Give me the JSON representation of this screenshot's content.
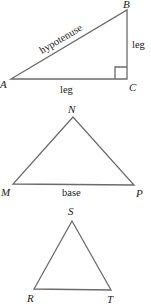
{
  "figure": {
    "right_triangle": {
      "vertices": {
        "A": "A",
        "B": "B",
        "C": "C"
      },
      "labels": {
        "hypotenuse": "hypotenuse",
        "vertical_leg": "leg",
        "horizontal_leg": "leg"
      },
      "right_angle_at": "C"
    },
    "base_triangle": {
      "vertices": {
        "N": "N",
        "M": "M",
        "P": "P"
      },
      "labels": {
        "base": "base"
      }
    },
    "third_triangle": {
      "vertices": {
        "S": "S",
        "R": "R",
        "T": "T"
      }
    }
  },
  "colors": {
    "stroke": "#6b6b6b",
    "text": "#222222",
    "background": "#ffffff"
  }
}
